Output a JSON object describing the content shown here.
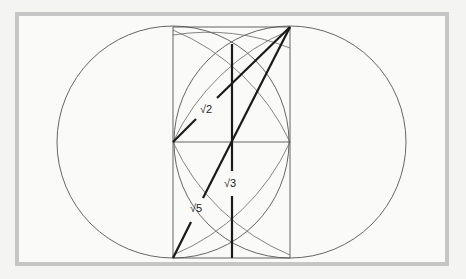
{
  "diagram": {
    "title": "",
    "labels": {
      "sqrt2": "√2",
      "sqrt3": "√3",
      "sqrt5": "√5"
    },
    "colors": {
      "background": "#f4f4f2",
      "frame": "#c8c8c8",
      "panel": "#fafaf9",
      "thin_line": "#555555",
      "thick_line": "#1a1a1a"
    }
  }
}
